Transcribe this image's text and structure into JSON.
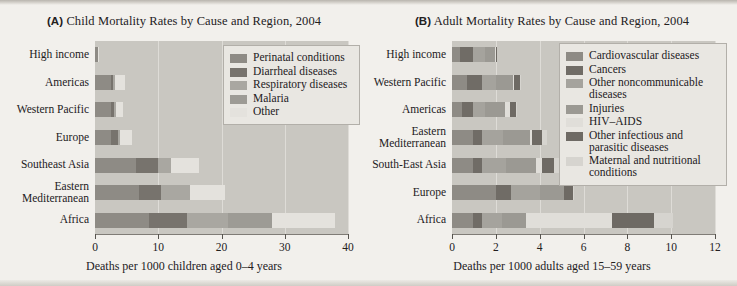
{
  "figure": {
    "panels": [
      {
        "id": "A",
        "tag": "(A)",
        "title": "Child Mortality Rates by Cause and Region, 2004",
        "xlabel": "Deaths per 1000 children aged 0–4 years",
        "xticks": [
          "0",
          "10",
          "20",
          "30",
          "40"
        ],
        "legend": [
          {
            "label": "Perinatal conditions",
            "color": "#8e8b85"
          },
          {
            "label": "Diarrheal diseases",
            "color": "#77736d"
          },
          {
            "label": "Respiratory diseases",
            "color": "#a9a7a1"
          },
          {
            "label": "Malaria",
            "color": "#9d9b95"
          },
          {
            "label": "Other",
            "color": "#e4e2dd"
          }
        ],
        "categories": [
          "High income",
          "Americas",
          "Western Pacific",
          "Europe",
          "Southeast Asia",
          "Eastern Mediterranean",
          "Africa"
        ]
      },
      {
        "id": "B",
        "tag": "(B)",
        "title": "Adult Mortality Rates by Cause and Region, 2004",
        "xlabel": "Deaths per 1000 adults aged 15–59 years",
        "xticks": [
          "0",
          "2",
          "4",
          "6",
          "8",
          "10",
          "12"
        ],
        "legend": [
          {
            "label": "Cardiovascular diseases",
            "color": "#8e8b85"
          },
          {
            "label": "Cancers",
            "color": "#706c66"
          },
          {
            "label": "Other noncommunicable diseases",
            "color": "#a5a39d"
          },
          {
            "label": "Injuries",
            "color": "#9b9993"
          },
          {
            "label": "HIV–AIDS",
            "color": "#e0ded9"
          },
          {
            "label": "Other infectious and parasitic diseases",
            "color": "#6e6a64"
          },
          {
            "label": "Maternal and nutritional conditions",
            "color": "#d6d4cf"
          }
        ],
        "categories": [
          "High income",
          "Western Pacific",
          "Americas",
          "Eastern Mediterranean",
          "South-East Asia",
          "Europe",
          "Africa"
        ]
      }
    ]
  },
  "chart_data": [
    {
      "type": "bar",
      "orientation": "horizontal",
      "stacked": true,
      "title": "(A) Child Mortality Rates by Cause and Region, 2004",
      "xlabel": "Deaths per 1000 children aged 0–4 years",
      "ylabel": "",
      "xlim": [
        0,
        40
      ],
      "xticks": [
        0,
        10,
        20,
        30,
        40
      ],
      "grid": "vertical",
      "legend_position": "upper-right-inside",
      "categories": [
        "High income",
        "Americas",
        "Western Pacific",
        "Europe",
        "Southeast Asia",
        "Eastern Mediterranean",
        "Africa"
      ],
      "series": [
        {
          "name": "Perinatal conditions",
          "color": "#8e8b85",
          "values": [
            0.4,
            2.5,
            2.6,
            2.6,
            6.5,
            7.0,
            8.5
          ]
        },
        {
          "name": "Diarrheal diseases",
          "color": "#77736d",
          "values": [
            0.0,
            0.4,
            0.4,
            1.1,
            3.5,
            3.5,
            6.0
          ]
        },
        {
          "name": "Respiratory diseases",
          "color": "#a9a7a1",
          "values": [
            0.0,
            0.2,
            0.3,
            0.3,
            2.0,
            4.5,
            6.5
          ]
        },
        {
          "name": "Malaria",
          "color": "#9d9b95",
          "values": [
            0.0,
            0.0,
            0.0,
            0.0,
            0.0,
            0.0,
            7.0
          ]
        },
        {
          "name": "Other",
          "color": "#e4e2dd",
          "values": [
            0.3,
            1.6,
            1.2,
            1.8,
            4.5,
            5.5,
            10.0
          ]
        }
      ],
      "totals": [
        0.7,
        4.7,
        4.5,
        5.8,
        16.5,
        20.5,
        38.0
      ]
    },
    {
      "type": "bar",
      "orientation": "horizontal",
      "stacked": true,
      "title": "(B) Adult Mortality Rates by Cause and Region, 2004",
      "xlabel": "Deaths per 1000 adults aged 15–59 years",
      "ylabel": "",
      "xlim": [
        0,
        12
      ],
      "xticks": [
        0,
        2,
        4,
        6,
        8,
        10,
        12
      ],
      "grid": "vertical",
      "legend_position": "upper-right-inside",
      "categories": [
        "High income",
        "Western Pacific",
        "Americas",
        "Eastern Mediterranean",
        "South-East Asia",
        "Europe",
        "Africa"
      ],
      "series": [
        {
          "name": "Cardiovascular diseases",
          "color": "#8e8b85",
          "values": [
            0.35,
            0.7,
            0.45,
            0.95,
            0.95,
            2.0,
            0.95
          ]
        },
        {
          "name": "Cancers",
          "color": "#706c66",
          "values": [
            0.6,
            0.65,
            0.5,
            0.4,
            0.4,
            0.7,
            0.4
          ]
        },
        {
          "name": "Other noncommunicable diseases",
          "color": "#a5a39d",
          "values": [
            0.55,
            0.65,
            0.55,
            1.0,
            1.1,
            1.3,
            0.95
          ]
        },
        {
          "name": "Injuries",
          "color": "#9b9993",
          "values": [
            0.45,
            0.8,
            0.9,
            1.2,
            1.4,
            1.1,
            1.1
          ]
        },
        {
          "name": "HIV–AIDS",
          "color": "#e0ded9",
          "values": [
            0.05,
            0.05,
            0.25,
            0.1,
            0.25,
            0.0,
            3.9
          ]
        },
        {
          "name": "Other infectious and parasitic diseases",
          "color": "#6e6a64",
          "values": [
            0.05,
            0.25,
            0.25,
            0.45,
            0.55,
            0.4,
            1.9
          ]
        },
        {
          "name": "Maternal and nutritional conditions",
          "color": "#d6d4cf",
          "values": [
            0.0,
            0.05,
            0.05,
            0.25,
            0.3,
            0.05,
            0.9
          ]
        }
      ],
      "totals": [
        2.05,
        3.15,
        2.95,
        4.35,
        4.95,
        5.55,
        10.1
      ]
    }
  ]
}
